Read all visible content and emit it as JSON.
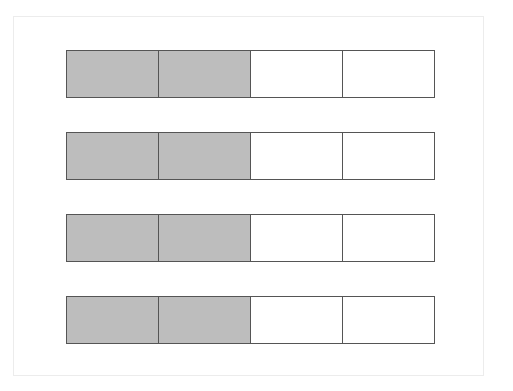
{
  "diagram": {
    "type": "fraction-bars",
    "colors": {
      "shaded": "#bdbdbd",
      "empty": "#ffffff",
      "border": "#555555",
      "frame": "#ececec"
    },
    "bars": [
      {
        "parts": 4,
        "shaded": 2,
        "top": 50
      },
      {
        "parts": 4,
        "shaded": 2,
        "top": 132
      },
      {
        "parts": 4,
        "shaded": 2,
        "top": 214
      },
      {
        "parts": 4,
        "shaded": 2,
        "top": 296
      }
    ]
  }
}
